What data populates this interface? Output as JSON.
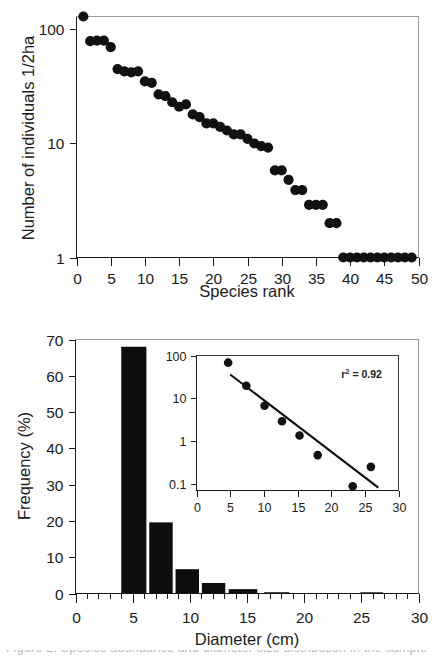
{
  "figure": {
    "caption_fragment": "Figure 2.  Species abundance and diameter size distribution in the sample"
  },
  "panels": [
    {
      "id": "rank-abundance",
      "name": "rank-abundance-plot"
    },
    {
      "id": "diameter-frequency",
      "name": "diameter-frequency-plot"
    }
  ],
  "chart_data": [
    {
      "type": "scatter",
      "id": "rank-abundance",
      "title": "",
      "xlabel": "Species rank",
      "ylabel": "Number of individuals 1/2ha",
      "xlim": [
        0,
        50
      ],
      "ylim": [
        1,
        130
      ],
      "yscale": "log",
      "grid": false,
      "legend": "none",
      "xticks": [
        0,
        5,
        10,
        15,
        20,
        25,
        30,
        35,
        40,
        45,
        50
      ],
      "xticklabels": [
        "0",
        "5",
        "10",
        "15",
        "20",
        "25",
        "30",
        "35",
        "40",
        "45",
        "50"
      ],
      "yticks": [
        1,
        10,
        100
      ],
      "yticklabels": [
        "1",
        "10",
        "100"
      ],
      "marker": "filled-circle",
      "x": [
        1,
        2,
        3,
        4,
        5,
        6,
        7,
        8,
        9,
        10,
        11,
        12,
        13,
        14,
        15,
        16,
        17,
        18,
        19,
        20,
        21,
        22,
        23,
        24,
        25,
        26,
        27,
        28,
        29,
        30,
        31,
        32,
        33,
        34,
        35,
        36,
        37,
        38,
        39,
        40,
        41,
        42,
        43,
        44,
        45,
        46,
        47,
        48,
        49
      ],
      "y": [
        130,
        79,
        80,
        80,
        70,
        45,
        43,
        42,
        43,
        35,
        34,
        27,
        26,
        23,
        21,
        22,
        18,
        17,
        15,
        15,
        14,
        13,
        12,
        12,
        11,
        10,
        9.5,
        9.2,
        5.8,
        5.8,
        4.8,
        3.9,
        3.9,
        2.9,
        2.9,
        2.9,
        2.0,
        2.0,
        1,
        1,
        1,
        1,
        1,
        1,
        1,
        1,
        1,
        1,
        1
      ]
    },
    {
      "type": "bar",
      "id": "diameter-frequency",
      "title": "",
      "xlabel": "Diameter (cm)",
      "ylabel": "Frequency (%)",
      "xlim": [
        0,
        30
      ],
      "ylim": [
        0,
        70
      ],
      "grid": false,
      "legend": "none",
      "xticks": [
        0,
        5,
        10,
        15,
        20,
        25,
        30
      ],
      "xticklabels": [
        "0",
        "5",
        "10",
        "15",
        "20",
        "25",
        "30"
      ],
      "yticks": [
        0,
        10,
        20,
        30,
        40,
        50,
        60,
        70
      ],
      "yticklabels": [
        "0",
        "10",
        "20",
        "30",
        "40",
        "50",
        "60",
        "70"
      ],
      "bars": [
        {
          "x_start": 4.0,
          "x_end": 6.2,
          "value": 68.0
        },
        {
          "x_start": 6.45,
          "x_end": 8.5,
          "value": 19.6
        },
        {
          "x_start": 8.75,
          "x_end": 10.8,
          "value": 6.7
        },
        {
          "x_start": 11.05,
          "x_end": 13.1,
          "value": 2.9
        },
        {
          "x_start": 13.4,
          "x_end": 15.9,
          "value": 1.2
        },
        {
          "x_start": 16.5,
          "x_end": 18.7,
          "value": 0.35
        },
        {
          "x_start": 24.9,
          "x_end": 26.9,
          "value": 0.12
        }
      ],
      "categories": [
        "5",
        "7.5",
        "10",
        "12.5",
        "15",
        "17.5",
        "26"
      ],
      "values": [
        68.0,
        19.6,
        6.7,
        2.9,
        1.2,
        0.35,
        0.12
      ]
    },
    {
      "type": "scatter",
      "id": "diameter-frequency-inset",
      "title": "",
      "xlabel": "",
      "ylabel": "",
      "xlim": [
        0,
        30
      ],
      "ylim": [
        0.07,
        100
      ],
      "yscale": "log",
      "grid": false,
      "legend": "none",
      "xticks": [
        0,
        5,
        10,
        15,
        20,
        25,
        30
      ],
      "xticklabels": [
        "0",
        "5",
        "10",
        "15",
        "20",
        "25",
        "30"
      ],
      "yticks": [
        0.1,
        1,
        10,
        100
      ],
      "yticklabels": [
        "0.1",
        "1",
        "10",
        "100"
      ],
      "marker": "filled-circle",
      "x": [
        4.7,
        7.4,
        10.1,
        12.7,
        15.3,
        18.0,
        23.2,
        25.9
      ],
      "y": [
        68.0,
        19.6,
        6.7,
        2.9,
        1.35,
        0.47,
        0.088,
        0.25
      ],
      "fit_line": {
        "x_start": 5.0,
        "y_start": 36.0,
        "x_end": 27.0,
        "y_end": 0.082
      },
      "annotations": [
        {
          "text_base": "r",
          "text_sup": "2",
          "text_rest": " = 0.92",
          "full": "r2 = 0.92",
          "x": 21.5,
          "y": 30.0
        }
      ]
    }
  ],
  "labels": {
    "top_ylabel": "Number of individuals 1/2ha",
    "top_xlabel": "Species rank",
    "bottom_ylabel": "Frequency (%)",
    "bottom_xlabel": "Diameter (cm)",
    "inset_r_squared_base": "r",
    "inset_r_squared_sup": "2",
    "inset_r_squared_rest": " = 0.92"
  },
  "colors": {
    "marker": "#111111",
    "bar": "#0d0d0d",
    "axis": "#1b1b1b",
    "frame": "#9a9a9a",
    "background": "#ffffff"
  }
}
